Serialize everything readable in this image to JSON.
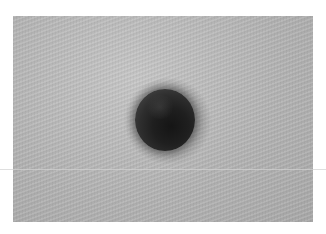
{
  "image": {
    "subject": "dark round mole on skin",
    "style": "grayscale close-up photograph",
    "colors": {
      "background": "#ffffff",
      "skin": "#b4b4b4",
      "mole": "#1f1f1f"
    }
  }
}
